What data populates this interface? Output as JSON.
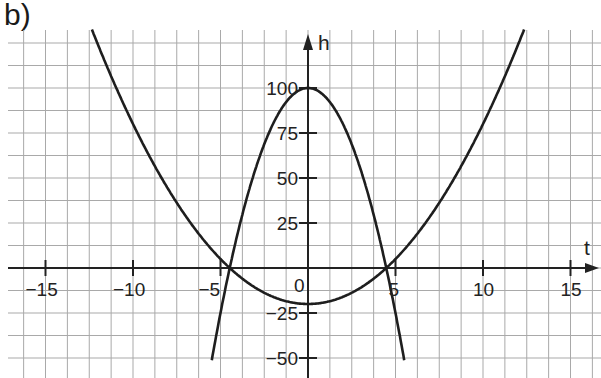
{
  "figure_label": "b)",
  "chart_data": {
    "type": "line",
    "title": "",
    "xlabel": "t",
    "ylabel": "h",
    "xlim": [
      -17,
      17
    ],
    "ylim": [
      -60,
      130
    ],
    "grid": true,
    "grid_x_step": 1.25,
    "grid_y_step": 12.5,
    "x_ticks": [
      -15,
      -10,
      -5,
      5,
      10,
      15
    ],
    "x_tick_labels": [
      "-15",
      "-10",
      "-5",
      "5",
      "10",
      "15"
    ],
    "y_ticks": [
      100,
      75,
      50,
      25,
      -25,
      -50
    ],
    "y_tick_labels": [
      "100",
      "75",
      "50",
      "25",
      "-25",
      "-50"
    ],
    "origin_label": "0",
    "series": [
      {
        "name": "downward parabola",
        "formula": "h = 100 - 5t^2",
        "points": [
          [
            -5.5,
            -51.25
          ],
          [
            -4.47,
            0
          ],
          [
            -4,
            20
          ],
          [
            -3,
            55
          ],
          [
            -2,
            80
          ],
          [
            -1,
            95
          ],
          [
            0,
            100
          ],
          [
            1,
            95
          ],
          [
            2,
            80
          ],
          [
            3,
            55
          ],
          [
            4,
            20
          ],
          [
            4.47,
            0
          ],
          [
            5.5,
            -51.25
          ]
        ]
      },
      {
        "name": "upward parabola",
        "formula": "h = t^2 - 20",
        "points": [
          [
            -12.5,
            136.25
          ],
          [
            -10,
            80
          ],
          [
            -8,
            44
          ],
          [
            -6,
            16
          ],
          [
            -4.47,
            0
          ],
          [
            -2,
            -16
          ],
          [
            0,
            -20
          ],
          [
            2,
            -16
          ],
          [
            4.47,
            0
          ],
          [
            6,
            16
          ],
          [
            8,
            44
          ],
          [
            10,
            80
          ],
          [
            12.5,
            136.25
          ]
        ]
      }
    ],
    "intersections": [
      [
        -4.47,
        0
      ],
      [
        4.47,
        0
      ]
    ]
  }
}
